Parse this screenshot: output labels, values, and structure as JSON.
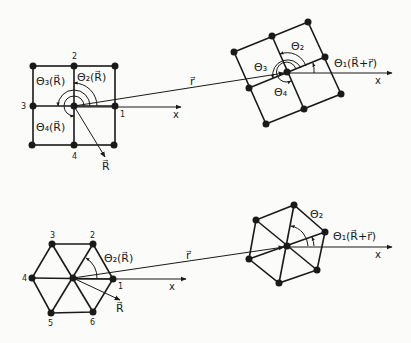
{
  "top_left": {
    "node_labels": [
      "1",
      "2",
      "3",
      "4"
    ],
    "theta_labels": [
      "Θ₂(R⃗)",
      "Θ₃(R⃗)",
      "Θ₄(R⃗)"
    ],
    "axis_label": "x",
    "vector_label": "R⃗"
  },
  "connector": {
    "top_label": "r⃗",
    "bottom_label": "r⃗"
  },
  "top_right": {
    "theta_labels": [
      "Θ₂",
      "Θ₃",
      "Θ₄"
    ],
    "theta1_label": "Θ₁(R⃗+r⃗)",
    "axis_label": "x"
  },
  "bottom_left": {
    "node_labels": [
      "1",
      "2",
      "3",
      "4",
      "5",
      "6"
    ],
    "theta_label": "Θ₂(R⃗)",
    "axis_label": "x",
    "vector_label": "R⃗"
  },
  "bottom_right": {
    "theta_label": "Θ₂",
    "theta1_label": "Θ₁(R⃗+r⃗)",
    "axis_label": "x"
  }
}
